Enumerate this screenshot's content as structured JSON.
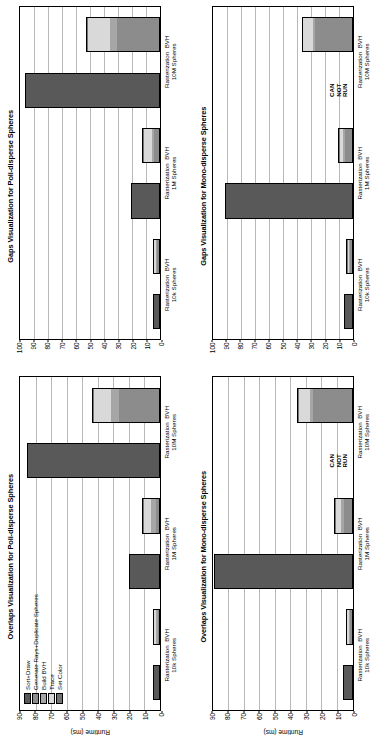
{
  "figure": {
    "orientation": "rotated-90-ccw",
    "panel_count": 4
  },
  "legend": {
    "title": "",
    "entries": [
      {
        "label": "Sort+Draw",
        "color": "#595959"
      },
      {
        "label": "Generate Rays+Duplicate Spheres",
        "color": "#8c8c8c"
      },
      {
        "label": "Build BVH",
        "color": "#a6a6a6"
      },
      {
        "label": "Trace",
        "color": "#d9d9d9"
      },
      {
        "label": "Set Color",
        "color": "#737373"
      }
    ]
  },
  "annotation": {
    "can_not_run": "CAN\nNOT\nRUN",
    "line1": "CAN",
    "line2": "NOT",
    "line3": "RUN"
  },
  "chart_data": [
    {
      "id": "overlaps-poly",
      "type": "bar",
      "stacked": true,
      "title": "Overlaps Visualization for Poli-disperse Spheres",
      "xlabel": "",
      "ylabel": "Runtime (ms)",
      "ylim": [
        0,
        90
      ],
      "yticks": [
        0,
        10,
        20,
        30,
        40,
        50,
        60,
        70,
        80,
        90
      ],
      "grid": true,
      "legend_position": "upper-left",
      "categories": [
        "Rasterization",
        "BVH",
        "Rasterization",
        "BVH",
        "Rasterization",
        "BVH"
      ],
      "group_labels": [
        "10k Spheres",
        "1M Spheres",
        "10M Spheres"
      ],
      "series": [
        {
          "name": "Sort+Draw",
          "color": "#595959",
          "values": [
            3.0,
            0.0,
            18.5,
            0.0,
            84.0,
            0.0
          ]
        },
        {
          "name": "Generate Rays+Duplicate Spheres",
          "color": "#8c8c8c",
          "values": [
            0.0,
            0.6,
            0.0,
            2.0,
            0.0,
            26.0
          ]
        },
        {
          "name": "Build BVH",
          "color": "#a6a6a6",
          "values": [
            0.0,
            1.2,
            0.0,
            3.0,
            0.0,
            5.0
          ]
        },
        {
          "name": "Trace",
          "color": "#d9d9d9",
          "values": [
            0.0,
            1.3,
            0.0,
            4.5,
            0.0,
            11.0
          ]
        },
        {
          "name": "Set Color",
          "color": "#737373",
          "values": [
            0.0,
            0.4,
            0.0,
            0.5,
            0.0,
            0.5
          ]
        }
      ]
    },
    {
      "id": "gaps-poly",
      "type": "bar",
      "stacked": true,
      "title": "Gaps Visualization for Poli-disperse Spheres",
      "xlabel": "",
      "ylabel": "",
      "ylim": [
        0,
        100
      ],
      "yticks": [
        0,
        10,
        20,
        30,
        40,
        50,
        60,
        70,
        80,
        90,
        100
      ],
      "grid": true,
      "legend_position": "none",
      "categories": [
        "Rasterization",
        "BVH",
        "Rasterization",
        "BVH",
        "Rasterization",
        "BVH"
      ],
      "group_labels": [
        "10k Spheres",
        "1M Spheres",
        "10M Spheres"
      ],
      "series": [
        {
          "name": "Sort+Draw",
          "color": "#595959",
          "values": [
            3.5,
            0.0,
            19.0,
            0.0,
            95.0,
            0.0
          ]
        },
        {
          "name": "Generate Rays+Duplicate Spheres",
          "color": "#8c8c8c",
          "values": [
            0.0,
            1.5,
            0.0,
            3.5,
            0.0,
            30.0
          ]
        },
        {
          "name": "Build BVH",
          "color": "#a6a6a6",
          "values": [
            0.0,
            0.8,
            0.0,
            1.5,
            0.0,
            5.0
          ]
        },
        {
          "name": "Trace",
          "color": "#d9d9d9",
          "values": [
            0.0,
            1.2,
            0.0,
            6.0,
            0.0,
            16.0
          ]
        },
        {
          "name": "Set Color",
          "color": "#737373",
          "values": [
            0.0,
            0.4,
            0.0,
            0.5,
            0.0,
            0.5
          ]
        }
      ]
    },
    {
      "id": "overlaps-mono",
      "type": "bar",
      "stacked": true,
      "title": "Overlaps Visualization for Mono-disperse Spheres",
      "xlabel": "",
      "ylabel": "Runtime (ms)",
      "ylim": [
        0,
        90
      ],
      "yticks": [
        0,
        10,
        20,
        30,
        40,
        50,
        60,
        70,
        80,
        90
      ],
      "grid": true,
      "legend_position": "none",
      "annotation_slot": 5,
      "categories": [
        "Rasterization",
        "BVH",
        "Rasterization",
        "BVH",
        "Rasterization",
        "BVH"
      ],
      "group_labels": [
        "10k Spheres",
        "1M Spheres",
        "10M Spheres"
      ],
      "series": [
        {
          "name": "Sort+Draw",
          "color": "#595959",
          "values": [
            5.0,
            0.0,
            88.0,
            0.0,
            0.0,
            0.0
          ]
        },
        {
          "name": "Generate Rays+Duplicate Spheres",
          "color": "#8c8c8c",
          "values": [
            0.0,
            1.0,
            0.0,
            5.0,
            0.0,
            25.0
          ]
        },
        {
          "name": "Build BVH",
          "color": "#a6a6a6",
          "values": [
            0.0,
            0.8,
            0.0,
            2.0,
            0.0,
            2.0
          ]
        },
        {
          "name": "Trace",
          "color": "#d9d9d9",
          "values": [
            0.0,
            1.0,
            0.0,
            3.0,
            0.0,
            7.0
          ]
        },
        {
          "name": "Set Color",
          "color": "#737373",
          "values": [
            0.0,
            0.3,
            0.0,
            0.5,
            0.0,
            0.5
          ]
        }
      ]
    },
    {
      "id": "gaps-mono",
      "type": "bar",
      "stacked": true,
      "title": "Gaps Visualization for Mono-disperse Spheres",
      "xlabel": "",
      "ylabel": "",
      "ylim": [
        0,
        100
      ],
      "yticks": [
        0,
        10,
        20,
        30,
        40,
        50,
        60,
        70,
        80,
        90,
        100
      ],
      "grid": true,
      "legend_position": "none",
      "annotation_slot": 5,
      "categories": [
        "Rasterization",
        "BVH",
        "Rasterization",
        "BVH",
        "Rasterization",
        "BVH"
      ],
      "group_labels": [
        "10k Spheres",
        "1M Spheres",
        "10M Spheres"
      ],
      "series": [
        {
          "name": "Sort+Draw",
          "color": "#595959",
          "values": [
            5.0,
            0.0,
            90.0,
            0.0,
            0.0,
            0.0
          ]
        },
        {
          "name": "Generate Rays+Duplicate Spheres",
          "color": "#8c8c8c",
          "values": [
            0.0,
            1.2,
            0.0,
            5.0,
            0.0,
            26.0
          ]
        },
        {
          "name": "Build BVH",
          "color": "#a6a6a6",
          "values": [
            0.0,
            0.5,
            0.0,
            1.0,
            0.0,
            1.5
          ]
        },
        {
          "name": "Trace",
          "color": "#d9d9d9",
          "values": [
            0.0,
            1.0,
            0.0,
            2.5,
            0.0,
            7.0
          ]
        },
        {
          "name": "Set Color",
          "color": "#737373",
          "values": [
            0.0,
            0.3,
            0.0,
            0.4,
            0.0,
            0.5
          ]
        }
      ]
    }
  ]
}
